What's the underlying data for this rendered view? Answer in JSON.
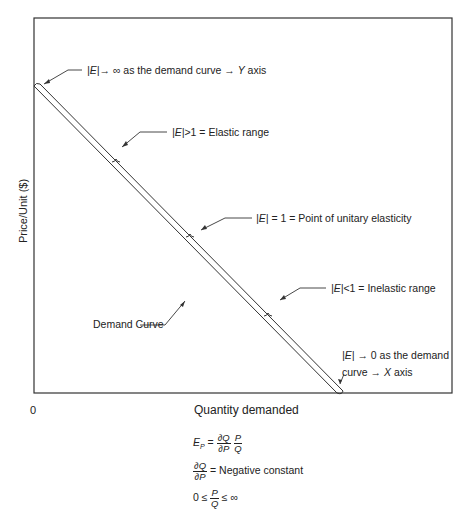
{
  "diagram": {
    "axes": {
      "y_label": "Price/Unit  ($)",
      "x_label": "Quantity demanded",
      "origin": "0"
    },
    "curve_label": "Demand Curve",
    "annotations": [
      {
        "id": "infinite",
        "abs": "|E|",
        "text": "→ ∞ as the demand curve → ",
        "axis": "Y",
        "suffix": " axis"
      },
      {
        "id": "elastic",
        "abs": "|E|",
        "text": ">1 = Elastic range"
      },
      {
        "id": "unitary",
        "abs": "|E|",
        "text": " = 1 = Point of unitary elasticity"
      },
      {
        "id": "inelastic",
        "abs": "|E|",
        "text": "<1 = Inelastic range"
      },
      {
        "id": "zero",
        "abs": "|E|",
        "line1": " → 0 as the demand",
        "line2": "curve → ",
        "axis": "X",
        "suffix": " axis"
      }
    ],
    "formulas": {
      "f1_lhs": "E",
      "f1_sub": "P",
      "f1_eq": " = ",
      "dq": "∂Q",
      "dp": "∂P",
      "p": "P",
      "q": "Q",
      "f2_rhs": " = Negative constant",
      "f3_left": "0 ≤ ",
      "f3_right": " ≤ ∞"
    }
  }
}
